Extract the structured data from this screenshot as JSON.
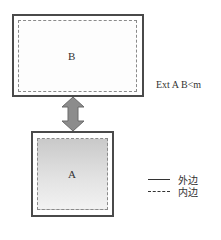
{
  "diagram": {
    "box_b": {
      "label": "B"
    },
    "box_a": {
      "label": "A"
    },
    "annotation": "Ext A B<m",
    "connector": {
      "type": "double-arrow",
      "color": "#8c8c8c"
    },
    "legend": [
      {
        "style": "solid",
        "label": "外边"
      },
      {
        "style": "dashed",
        "label": "内边"
      }
    ],
    "colors": {
      "outer_border": "#4a4a4a",
      "inner_border": "#8a8a8a",
      "fill_a_top": "#c9c9c9",
      "fill_a_bottom": "#f2f2f2"
    }
  }
}
